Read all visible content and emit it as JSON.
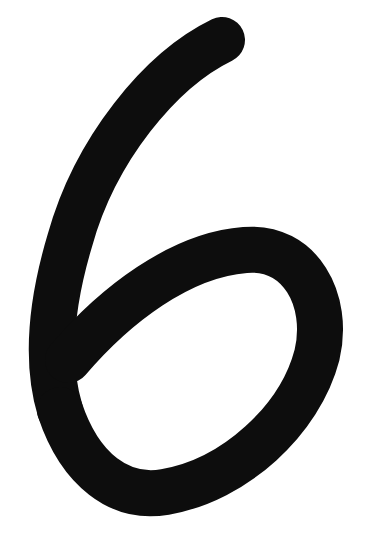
{
  "image": {
    "subject": "Handwritten numeral six",
    "glyph": "6",
    "background_color": "#ffffff",
    "stroke_color": "#0d0d0d"
  }
}
